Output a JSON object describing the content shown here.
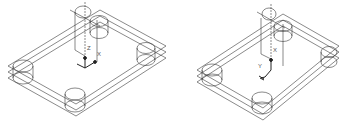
{
  "views": [
    {
      "name": "left-view",
      "gizmo": "ucs-axis",
      "axis_labels": {
        "z": "Z",
        "x": "X",
        "y": "Y"
      }
    },
    {
      "name": "right-view",
      "gizmo": "ucs-axis-rotated",
      "axis_labels": {
        "x": "X",
        "y": "Y"
      }
    }
  ],
  "colors": {
    "line": "#3a3a3a",
    "background": "#ffffff",
    "gizmo": "#222222"
  }
}
